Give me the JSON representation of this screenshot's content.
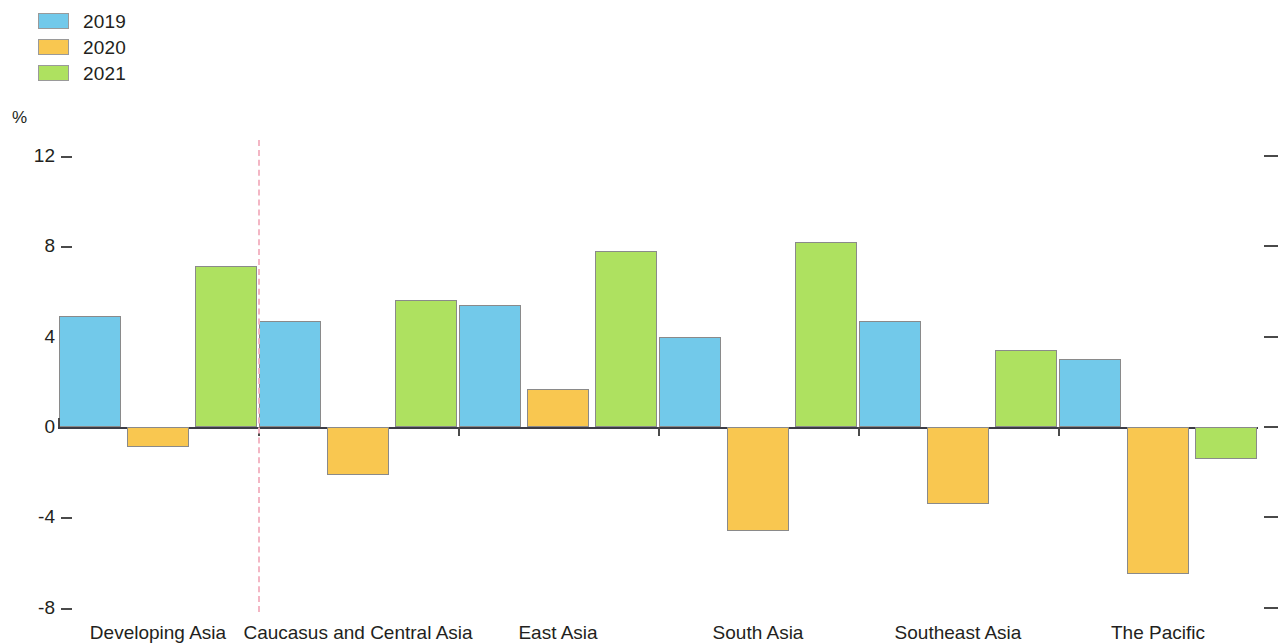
{
  "legend": {
    "position": "top-left",
    "entries": [
      {
        "label": "2019",
        "color": "#72C9EA"
      },
      {
        "label": "2020",
        "color": "#F9C750"
      },
      {
        "label": "2021",
        "color": "#AEE160"
      }
    ]
  },
  "axis": {
    "unit_label": "%",
    "y_ticks": [
      "12",
      "8",
      "4",
      "0",
      "-4",
      "-8"
    ]
  },
  "annotations": {
    "divider_color": "#f3b6c4"
  },
  "chart_data": {
    "type": "bar",
    "title": "",
    "subtitle": "",
    "xlabel": "",
    "ylabel": "%",
    "ylim": [
      -8,
      12
    ],
    "ytick_values": [
      12,
      8,
      4,
      0,
      -4,
      -8
    ],
    "grid": false,
    "legend_position": "top-left",
    "categories": [
      "Developing Asia",
      "Caucasus and Central Asia",
      "East Asia",
      "South Asia",
      "Southeast Asia",
      "The Pacific"
    ],
    "series": [
      {
        "name": "2019",
        "color": "#72C9EA",
        "values": [
          4.9,
          4.7,
          5.4,
          4.0,
          4.7,
          3.0
        ]
      },
      {
        "name": "2020",
        "color": "#F9C750",
        "values": [
          -0.9,
          -2.1,
          1.7,
          -4.6,
          -3.4,
          -6.5
        ]
      },
      {
        "name": "2021",
        "color": "#AEE160",
        "values": [
          7.1,
          5.6,
          7.8,
          8.2,
          3.4,
          -1.4
        ]
      }
    ],
    "annotations": [
      {
        "type": "vline",
        "after_category": "Developing Asia",
        "style": "dashed",
        "color": "#f3b6c4"
      }
    ]
  }
}
